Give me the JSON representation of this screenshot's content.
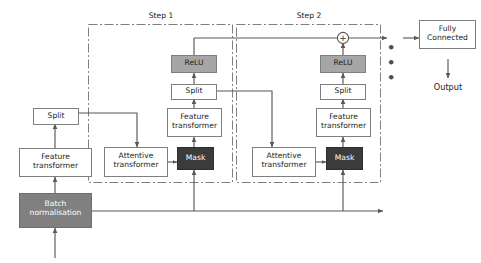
{
  "diagram": {
    "colors": {
      "box_stroke": "#7f7f7f",
      "box_fill": "#ffffff",
      "relu_fill": "#a6a6a6",
      "batchnorm_fill": "#808080",
      "mask_fill": "#3b3b3b",
      "line": "#595959",
      "step_border": "#808080",
      "text_dark": "#231f20",
      "text_light": "#ffffff"
    },
    "steps": [
      {
        "id": "step1",
        "label": "Step 1"
      },
      {
        "id": "step2",
        "label": "Step 2"
      }
    ],
    "nodes": [
      {
        "id": "split-left",
        "label": "Split",
        "style": "white"
      },
      {
        "id": "feature-left",
        "label": "Feature\ntransformer",
        "style": "white"
      },
      {
        "id": "batch-norm",
        "label": "Batch\nnormalisation",
        "style": "batchnorm"
      },
      {
        "id": "attentive-1",
        "label": "Attentive\ntransformer",
        "style": "white"
      },
      {
        "id": "mask-1",
        "label": "Mask",
        "style": "mask"
      },
      {
        "id": "feature-1",
        "label": "Feature\ntransformer",
        "style": "white"
      },
      {
        "id": "split-1",
        "label": "Split",
        "style": "white"
      },
      {
        "id": "relu-1",
        "label": "ReLU",
        "style": "relu"
      },
      {
        "id": "attentive-2",
        "label": "Attentive\ntransformer",
        "style": "white"
      },
      {
        "id": "mask-2",
        "label": "Mask",
        "style": "mask"
      },
      {
        "id": "feature-2",
        "label": "Feature\ntransformer",
        "style": "white"
      },
      {
        "id": "split-2",
        "label": "Split",
        "style": "white"
      },
      {
        "id": "relu-2",
        "label": "ReLU",
        "style": "relu"
      },
      {
        "id": "fully-connected",
        "label": "Fully\nConnected",
        "style": "white"
      }
    ],
    "annotations": {
      "output_label": "Output",
      "ellipsis": "• • •",
      "sum_symbol": "+"
    }
  }
}
